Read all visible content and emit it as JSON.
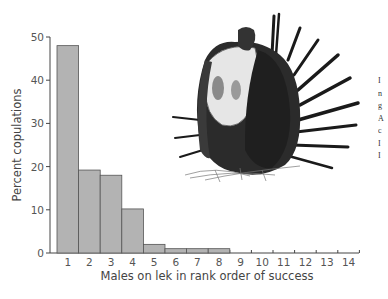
{
  "chart_data": {
    "type": "bar",
    "title": "",
    "xlabel": "Males on lek in rank order of success",
    "ylabel": "Percent copulations",
    "categories": [
      "1",
      "2",
      "3",
      "4",
      "5",
      "6",
      "7",
      "8",
      "9",
      "10",
      "11",
      "12",
      "13",
      "14"
    ],
    "values": [
      48,
      19.2,
      18,
      10.2,
      2,
      1,
      1,
      1,
      0,
      0,
      0,
      0,
      0,
      0
    ],
    "ylim": [
      0,
      50
    ],
    "yticks": [
      "0",
      "10",
      "20",
      "30",
      "40",
      "50"
    ],
    "grid": false,
    "legend": "none",
    "illustration": "sage-grouse-displaying",
    "bar_color": "#b3b3b3"
  },
  "caption_fragment": [
    "I",
    "n",
    "g",
    "A",
    "c",
    "I",
    "I"
  ]
}
